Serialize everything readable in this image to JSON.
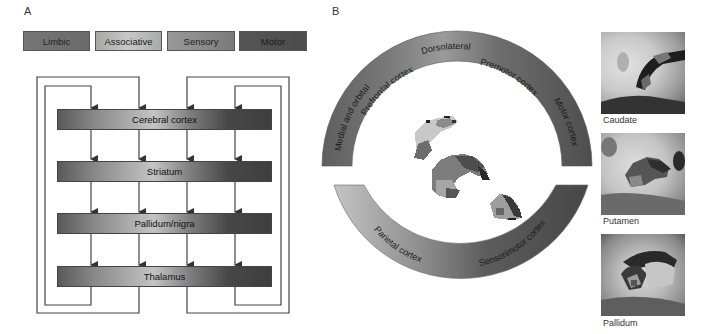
{
  "panel_a": {
    "label": "A",
    "legend": [
      {
        "label": "Limbic",
        "color": "#6f6f6f"
      },
      {
        "label": "Associative",
        "color": "#b4b4b4"
      },
      {
        "label": "Sensory",
        "color": "#8a8a8a"
      },
      {
        "label": "Motor",
        "color": "#515151"
      }
    ],
    "bars": [
      {
        "label": "Cerebral cortex"
      },
      {
        "label": "Striatum"
      },
      {
        "label": "Pallidum/nigra"
      },
      {
        "label": "Thalamus"
      }
    ],
    "loops": {
      "columns": 4,
      "description": "Four parallel cortico-basal ganglia-thalamo-cortical loops: Cerebral cortex → Striatum → Pallidum/nigra → Thalamus → back to Cerebral cortex"
    }
  },
  "panel_b": {
    "label": "B",
    "arc_labels_top": [
      "Medial and orbital",
      "Prefrontal cortex",
      "Dorsolateral",
      "Premotor cortex",
      "Motor cortex"
    ],
    "arc_labels_bottom": [
      "Parietal cortex",
      "Sensorimotor cortex"
    ],
    "mri_images": [
      {
        "caption": "Caudate"
      },
      {
        "caption": "Putamen"
      },
      {
        "caption": "Pallidum"
      }
    ]
  }
}
